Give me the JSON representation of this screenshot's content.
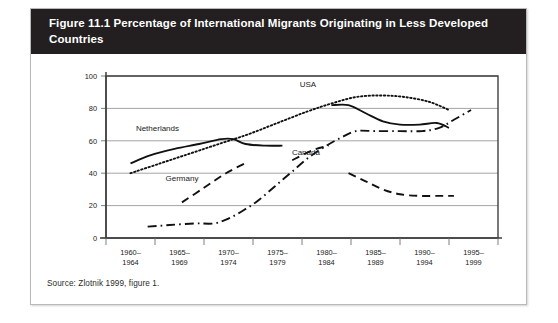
{
  "figure": {
    "title": "Figure 11.1 Percentage of International Migrants Originating in Less Developed Countries",
    "source": "Source: Zlotnik 1999, figure 1.",
    "header_color": "#231f20",
    "line_color": "#111111"
  },
  "chart_data": {
    "type": "line",
    "title": "Figure 11.1 Percentage of International Migrants Originating in Less Developed Countries",
    "xlabel": "",
    "ylabel": "",
    "ylim": [
      0,
      100
    ],
    "yticks": [
      0,
      20,
      40,
      60,
      80,
      100
    ],
    "grid": true,
    "legend": "inline-annotations",
    "categories": [
      "1960–1964",
      "1965–1969",
      "1970–1974",
      "1975–1979",
      "1980–1984",
      "1985–1989",
      "1990–1994",
      "1995–1999"
    ],
    "series": [
      {
        "name": "Netherlands",
        "style": "solid",
        "segments": [
          {
            "x": [
              0,
              0.4,
              0.9,
              1.4,
              1.85,
              2.1,
              2.35,
              2.75,
              3.1
            ],
            "values": [
              46,
              51,
              55,
              58,
              61,
              61,
              58,
              57,
              57
            ]
          },
          {
            "x": [
              4.1,
              4.45,
              4.8,
              5.15,
              5.5,
              5.9,
              6.25,
              6.5
            ],
            "values": [
              82,
              82,
              77,
              72,
              70,
              70,
              71,
              68
            ]
          }
        ]
      },
      {
        "name": "USA",
        "style": "dotted",
        "segments": [
          {
            "x": [
              0,
              0.6,
              1.2,
              1.8,
              2.4,
              3.0,
              3.6,
              4.1,
              4.6,
              5.1,
              5.6,
              6.1,
              6.5
            ],
            "values": [
              40,
              46,
              52,
              58,
              64,
              71,
              78,
              83,
              87,
              88,
              87,
              84,
              79
            ]
          }
        ]
      },
      {
        "name": "Germany",
        "style": "dashed",
        "segments": [
          {
            "x": [
              1.05,
              1.5,
              1.95,
              2.4
            ],
            "values": [
              22,
              31,
              40,
              47
            ]
          },
          {
            "x": [
              3.3,
              3.7,
              4.05
            ],
            "values": [
              48,
              54,
              57
            ]
          },
          {
            "x": [
              4.45,
              4.8,
              5.15,
              5.5,
              5.9,
              6.3,
              6.6
            ],
            "values": [
              40,
              35,
              30,
              27,
              26,
              26,
              26
            ]
          }
        ]
      },
      {
        "name": "Canada",
        "style": "dashdot",
        "segments": [
          {
            "x": [
              0.35,
              0.8,
              1.3,
              1.7,
              2.0,
              2.3,
              2.6,
              2.95,
              3.3,
              3.65,
              4.0,
              4.3,
              4.6,
              5.0,
              5.5,
              5.95,
              6.3,
              6.6,
              6.95
            ],
            "values": [
              7,
              8,
              9,
              9,
              12,
              17,
              23,
              32,
              41,
              50,
              57,
              62,
              66,
              66,
              66,
              66,
              68,
              73,
              79
            ]
          }
        ]
      }
    ],
    "annotations": [
      {
        "text": "Netherlands",
        "x": 0.55,
        "y": 66
      },
      {
        "text": "USA",
        "x": 3.62,
        "y": 93
      },
      {
        "text": "Germany",
        "x": 1.05,
        "y": 35
      },
      {
        "text": "Canada",
        "x": 3.58,
        "y": 51
      }
    ]
  }
}
